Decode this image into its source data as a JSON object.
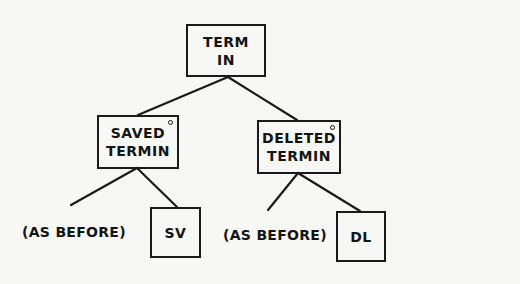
{
  "diagram": {
    "type": "tree",
    "root": {
      "id": "term-in",
      "lines": [
        "TERM",
        "IN"
      ],
      "marker": false
    },
    "children": [
      {
        "id": "saved-termin",
        "lines": [
          "SAVED",
          "TERMIN"
        ],
        "marker": true,
        "children": [
          {
            "id": "saved-as-before",
            "type": "text",
            "text": "(AS BEFORE)"
          },
          {
            "id": "sv",
            "type": "box",
            "lines": [
              "SV"
            ]
          }
        ]
      },
      {
        "id": "deleted-termin",
        "lines": [
          "DELETED",
          "TERMIN"
        ],
        "marker": true,
        "children": [
          {
            "id": "deleted-as-before",
            "type": "text",
            "text": "(AS BEFORE)"
          },
          {
            "id": "dl",
            "type": "box",
            "lines": [
              "DL"
            ]
          }
        ]
      }
    ],
    "edges": [
      [
        "term-in",
        "saved-termin"
      ],
      [
        "term-in",
        "deleted-termin"
      ],
      [
        "saved-termin",
        "saved-as-before"
      ],
      [
        "saved-termin",
        "sv"
      ],
      [
        "deleted-termin",
        "deleted-as-before"
      ],
      [
        "deleted-termin",
        "dl"
      ]
    ],
    "colors": {
      "ink": "#1a1a1a",
      "paper": "#f7f7f5"
    }
  }
}
